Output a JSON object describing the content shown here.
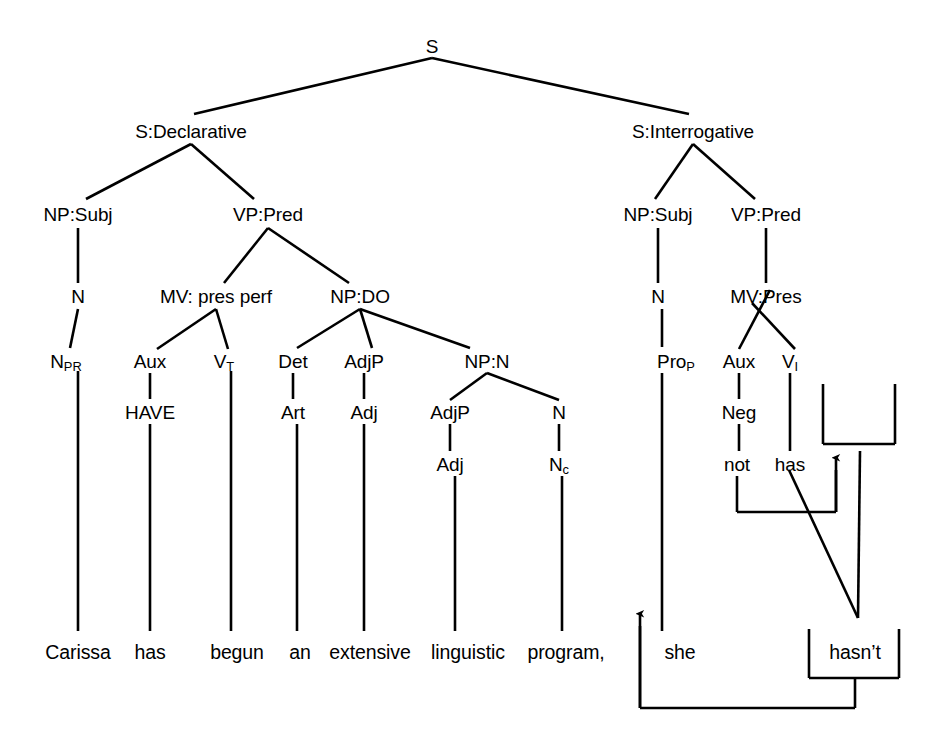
{
  "diagram": {
    "root_label": "S",
    "sentence_words": [
      "Carissa",
      "has",
      "begun",
      "an",
      "extensive",
      "linguistic",
      "program,",
      "she",
      "hasn’t"
    ],
    "line_color": "#000000",
    "text_color": "#000000",
    "background_color": "#ffffff"
  },
  "nodes": {
    "root": {
      "label": "S",
      "x": 432,
      "y": 46
    },
    "decl": {
      "label": "S:Declarative",
      "x": 191,
      "y": 131
    },
    "interr": {
      "label": "S:Interrogative",
      "x": 693,
      "y": 131
    },
    "d_np_subj": {
      "label": "NP:Subj",
      "x": 78,
      "y": 214
    },
    "d_vp_pred": {
      "label": "VP:Pred",
      "x": 268,
      "y": 214
    },
    "d_n": {
      "label": "N",
      "x": 78,
      "y": 296
    },
    "d_mv": {
      "label": "MV: pres perf",
      "x": 216,
      "y": 296
    },
    "d_np_do": {
      "label": "NP:DO",
      "x": 360,
      "y": 296
    },
    "d_npr": {
      "label": "N",
      "sub": "PR",
      "x": 66,
      "y": 361
    },
    "d_aux": {
      "label": "Aux",
      "x": 150,
      "y": 361
    },
    "d_vt": {
      "label": "V",
      "sub": "T",
      "x": 224,
      "y": 361
    },
    "d_det": {
      "label": "Det",
      "x": 293,
      "y": 361
    },
    "d_adjp1": {
      "label": "AdjP",
      "x": 364,
      "y": 361
    },
    "d_npn": {
      "label": "NP:N",
      "x": 487,
      "y": 361
    },
    "d_have": {
      "label": "HAVE",
      "x": 150,
      "y": 412
    },
    "d_art": {
      "label": "Art",
      "x": 293,
      "y": 412
    },
    "d_adj1": {
      "label": "Adj",
      "x": 364,
      "y": 412
    },
    "d_adjp2": {
      "label": "AdjP",
      "x": 450,
      "y": 412
    },
    "d_n2": {
      "label": "N",
      "x": 559,
      "y": 412
    },
    "d_adj2": {
      "label": "Adj",
      "x": 450,
      "y": 464
    },
    "d_nc": {
      "label": "N",
      "sub": "c",
      "x": 559,
      "y": 464
    },
    "i_np_subj": {
      "label": "NP:Subj",
      "x": 658,
      "y": 214
    },
    "i_vp_pred": {
      "label": "VP:Pred",
      "x": 766,
      "y": 214
    },
    "i_n": {
      "label": "N",
      "x": 658,
      "y": 296
    },
    "i_mv": {
      "label": "MV:Pres",
      "x": 766,
      "y": 296
    },
    "i_prop": {
      "label": "Pro",
      "sub": "P",
      "x": 676,
      "y": 361
    },
    "i_aux": {
      "label": "Aux",
      "x": 739,
      "y": 361
    },
    "i_vi": {
      "label": "V",
      "sub": "I",
      "x": 790,
      "y": 361
    },
    "i_neg": {
      "label": "Neg",
      "x": 739,
      "y": 412
    },
    "i_not": {
      "label": "not",
      "x": 737,
      "y": 464
    },
    "i_has": {
      "label": "has",
      "x": 790,
      "y": 464
    }
  },
  "words": [
    {
      "label": "Carissa",
      "x": 78,
      "y": 653
    },
    {
      "label": "has",
      "x": 150,
      "y": 653
    },
    {
      "label": "begun",
      "x": 237,
      "y": 653
    },
    {
      "label": "an",
      "x": 300,
      "y": 653
    },
    {
      "label": "extensive",
      "x": 370,
      "y": 653
    },
    {
      "label": "linguistic",
      "x": 468,
      "y": 653
    },
    {
      "label": "program,",
      "x": 566,
      "y": 653
    },
    {
      "label": "she",
      "x": 680,
      "y": 653
    },
    {
      "label": "hasn’t",
      "x": 855,
      "y": 653
    }
  ],
  "movement": {
    "contraction_note": "has + not → hasn’t (negative contraction), then raised to tag position",
    "arrow_up_label": "contraction-arrow",
    "arrow_left_label": "tag-placement-arrow"
  }
}
